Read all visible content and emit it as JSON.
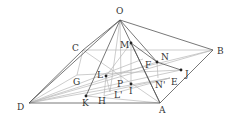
{
  "diagram": {
    "points": [
      {
        "id": "O",
        "x": 120,
        "y": 20,
        "lx": 116,
        "ly": 14,
        "dot": false
      },
      {
        "id": "B",
        "x": 213,
        "y": 50,
        "lx": 217,
        "ly": 54,
        "dot": false
      },
      {
        "id": "C",
        "x": 83,
        "y": 50,
        "lx": 72,
        "ly": 51,
        "dot": false
      },
      {
        "id": "D",
        "x": 29,
        "y": 103,
        "lx": 17,
        "ly": 110,
        "dot": false
      },
      {
        "id": "A",
        "x": 160,
        "y": 103,
        "lx": 159,
        "ly": 113,
        "dot": false
      },
      {
        "id": "M",
        "x": 131,
        "y": 43,
        "lx": 120,
        "ly": 48,
        "dot": true
      },
      {
        "id": "N",
        "x": 157,
        "y": 62,
        "lx": 161,
        "ly": 60,
        "dot": true
      },
      {
        "id": "F",
        "x": 143,
        "y": 59,
        "lx": 145,
        "ly": 68,
        "dot": false
      },
      {
        "id": "J",
        "x": 181,
        "y": 70,
        "lx": 185,
        "ly": 77,
        "dot": true
      },
      {
        "id": "E",
        "x": 170,
        "y": 78,
        "lx": 171,
        "ly": 85,
        "dot": false
      },
      {
        "id": "N'",
        "x": 158,
        "y": 78,
        "lx": 155,
        "ly": 88,
        "dot": false
      },
      {
        "id": "L",
        "x": 106,
        "y": 76,
        "lx": 97,
        "ly": 78,
        "dot": true
      },
      {
        "id": "G",
        "x": 77,
        "y": 75,
        "lx": 73,
        "ly": 85,
        "dot": false
      },
      {
        "id": "K",
        "x": 86,
        "y": 96,
        "lx": 82,
        "ly": 106,
        "dot": true
      },
      {
        "id": "H",
        "x": 104,
        "y": 96,
        "lx": 98,
        "ly": 104,
        "dot": false
      },
      {
        "id": "L'",
        "x": 110,
        "y": 92,
        "lx": 114,
        "ly": 98,
        "dot": false
      },
      {
        "id": "P",
        "x": 121,
        "y": 80,
        "lx": 117,
        "ly": 87,
        "dot": false
      },
      {
        "id": "I",
        "x": 131,
        "y": 84,
        "lx": 129,
        "ly": 94,
        "dot": true
      }
    ],
    "dark_edges": [
      [
        "O",
        "D"
      ],
      [
        "O",
        "B"
      ],
      [
        "O",
        "A"
      ],
      [
        "O",
        "C"
      ],
      [
        "D",
        "A"
      ],
      [
        "A",
        "B"
      ],
      [
        "O",
        "K"
      ],
      [
        "D",
        "C"
      ],
      [
        "M",
        "A"
      ],
      [
        "M",
        "N"
      ],
      [
        "N",
        "J"
      ],
      [
        "O",
        "N"
      ]
    ],
    "light_edges": [
      [
        "C",
        "B"
      ],
      [
        "D",
        "B"
      ],
      [
        "D",
        "J"
      ],
      [
        "C",
        "A"
      ],
      [
        "C",
        "G"
      ],
      [
        "G",
        "D"
      ],
      [
        "L",
        "H"
      ],
      [
        "M",
        "L"
      ],
      [
        "M",
        "I"
      ],
      [
        "N",
        "N'"
      ],
      [
        "D",
        "N"
      ],
      [
        "D",
        "E"
      ],
      [
        "K",
        "E"
      ],
      [
        "H",
        "E"
      ],
      [
        "G",
        "J"
      ],
      [
        "O",
        "L'"
      ],
      [
        "L",
        "B"
      ],
      [
        "L",
        "L'"
      ],
      [
        "P",
        "O"
      ],
      [
        "D",
        "F"
      ],
      [
        "K",
        "A"
      ]
    ]
  }
}
